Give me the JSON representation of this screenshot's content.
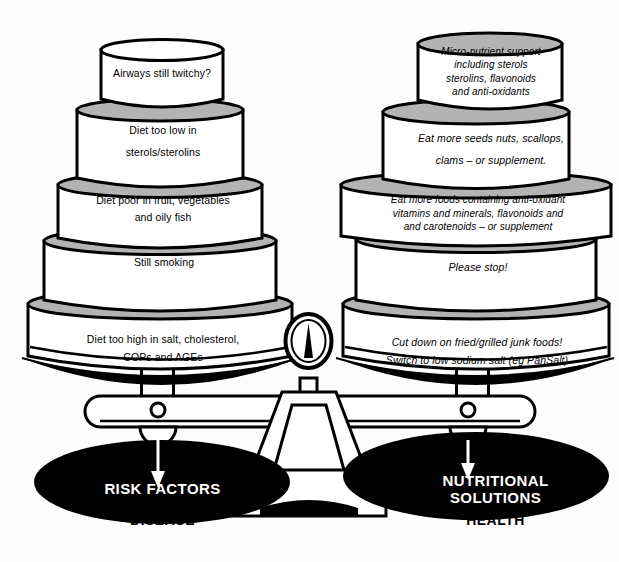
{
  "diagram": {
    "colors": {
      "ink": "#000000",
      "paper": "#fdfdfd",
      "tier_top_grey": "#b3b3b3",
      "tier_body_white": "#ffffff",
      "pan_black": "#000000",
      "label_white": "#ffffff"
    }
  },
  "left_stack": {
    "side_name": "risk-factors",
    "tiers": [
      {
        "id": "tier-airways",
        "text": "Airways still twitchy?"
      },
      {
        "id": "tier-sterols",
        "text": "Diet too low in\nsterols/sterolins"
      },
      {
        "id": "tier-fruit-veg",
        "text": "Diet poor in fruit, vegetables\nand oily fish"
      },
      {
        "id": "tier-smoking",
        "text": "Still smoking"
      },
      {
        "id": "tier-salt",
        "text": "Diet too high in salt, cholesterol,\nCOPs and AGEs"
      }
    ]
  },
  "right_stack": {
    "side_name": "nutritional-solutions",
    "tiers": [
      {
        "id": "tier-micronutrient",
        "text": "Micro-nutrient support\nincluding sterols\nsterolins, flavonoids\nand anti-oxidants"
      },
      {
        "id": "tier-seeds",
        "text": "Eat more seeds nuts, scallops,\nclams – or supplement."
      },
      {
        "id": "tier-antioxidant",
        "text": "Eat more foods containing anti-oxidant\nvitamins and minerals, flavonoids and\nand carotenoids – or supplement"
      },
      {
        "id": "tier-please-stop",
        "text": "Please stop!"
      },
      {
        "id": "tier-junk-food",
        "text": "Cut down on fried/grilled junk foods!\nSwitch to low sodium salt (eg PanSalt)"
      }
    ]
  },
  "pans": {
    "left": {
      "pan_label": "RISK FACTORS",
      "outcome_label": "DISEASE"
    },
    "right": {
      "pan_label": "NUTRITIONAL\nSOLUTIONS",
      "outcome_label": "HEALTH"
    }
  }
}
